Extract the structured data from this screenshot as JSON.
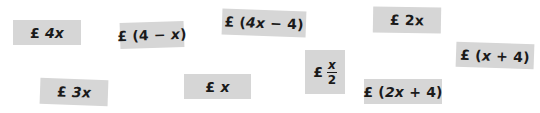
{
  "cards": [
    {
      "id": "4x",
      "pound": "£",
      "pre": "",
      "var": "4x",
      "post": ""
    },
    {
      "id": "4-x",
      "pound": "£",
      "pre": "(4 − ",
      "var": "x",
      "post": ")"
    },
    {
      "id": "4x-4",
      "pound": "£",
      "pre": "(",
      "var": "4x",
      "post": " − 4)"
    },
    {
      "id": "2x",
      "pound": "£",
      "pre": "",
      "var": "2x",
      "post": ""
    },
    {
      "id": "x+4",
      "pound": "£",
      "pre": "(",
      "var": "x",
      "post": " + 4)"
    },
    {
      "id": "3x",
      "pound": "£",
      "pre": "",
      "var": "3x",
      "post": ""
    },
    {
      "id": "x",
      "pound": "£",
      "pre": "",
      "var": "x",
      "post": ""
    },
    {
      "id": "x-over-2",
      "pound": "£",
      "numerator": "x",
      "denominator": "2"
    },
    {
      "id": "2x+4",
      "pound": "£",
      "pre": "(",
      "var": "2x",
      "post": " + 4)"
    }
  ]
}
